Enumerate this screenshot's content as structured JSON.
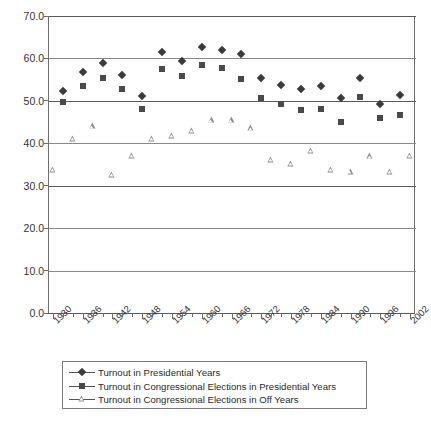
{
  "chart_data": {
    "type": "scatter",
    "title": "",
    "subtitle": "",
    "xlabel": "",
    "ylabel": "",
    "xlim": [
      1929,
      2003
    ],
    "ylim": [
      0.0,
      70.0
    ],
    "ytick_labels": [
      "70.0",
      "60.0",
      "50.0",
      "40.0",
      "30.0",
      "20.0",
      "10.0",
      "0.0"
    ],
    "ytick_values": [
      70.0,
      60.0,
      50.0,
      40.0,
      30.0,
      20.0,
      10.0,
      0.0
    ],
    "xtick_labels": [
      "1930",
      "1936",
      "1942",
      "1948",
      "1954",
      "1960",
      "1966",
      "1972",
      "1978",
      "1984",
      "1990",
      "1996",
      "2002"
    ],
    "xtick_values": [
      1930,
      1936,
      1942,
      1948,
      1954,
      1960,
      1966,
      1972,
      1978,
      1984,
      1990,
      1996,
      2002
    ],
    "xtick_step": 2,
    "grid": "horizontal",
    "legend_position": "below",
    "marker_colors": {
      "presidential": "#3b3b3b",
      "congressional_presidential": "#4a4a4a",
      "congressional_off": "#8d8d8d",
      "gridline": "#8a8a8a",
      "axis": "#5a5a5a"
    },
    "series": [
      {
        "name": "Turnout in Presidential Years",
        "marker": "diamond",
        "x": [
          1932,
          1936,
          1940,
          1944,
          1948,
          1952,
          1956,
          1960,
          1964,
          1968,
          1972,
          1976,
          1980,
          1984,
          1988,
          1992,
          1996,
          2000
        ],
        "values": [
          52.4,
          56.9,
          58.9,
          56.0,
          51.1,
          61.6,
          59.3,
          62.8,
          62.1,
          61.0,
          55.4,
          53.8,
          52.8,
          53.5,
          50.6,
          55.3,
          49.2,
          51.4
        ]
      },
      {
        "name": "Turnout in Congressional Elections in Presidential Years",
        "marker": "square",
        "x": [
          1932,
          1936,
          1940,
          1944,
          1948,
          1952,
          1956,
          1960,
          1964,
          1968,
          1972,
          1976,
          1980,
          1984,
          1988,
          1992,
          1996,
          2000
        ],
        "values": [
          49.7,
          53.5,
          55.4,
          52.7,
          48.1,
          57.6,
          55.9,
          58.5,
          57.8,
          55.1,
          50.7,
          49.2,
          47.9,
          48.1,
          45.1,
          50.9,
          46.0,
          46.7
        ]
      },
      {
        "name": "Turnout in Congressional Elections in Off Years",
        "marker": "triangle",
        "x": [
          1930,
          1934,
          1938,
          1942,
          1946,
          1950,
          1954,
          1958,
          1962,
          1966,
          1970,
          1974,
          1978,
          1982,
          1986,
          1990,
          1994,
          1998,
          2002
        ],
        "values": [
          33.7,
          41.1,
          44.0,
          32.5,
          37.1,
          41.1,
          41.7,
          43.0,
          45.4,
          45.4,
          43.5,
          36.1,
          35.1,
          38.2,
          33.7,
          33.3,
          36.9,
          33.2,
          37.1
        ]
      }
    ]
  },
  "legend": {
    "items": [
      {
        "label": "Turnout in Presidential Years",
        "marker": "diamond"
      },
      {
        "label": "Turnout in Congressional Elections in Presidential Years",
        "marker": "square"
      },
      {
        "label": "Turnout in Congressional Elections in Off Years",
        "marker": "triangle"
      }
    ]
  }
}
